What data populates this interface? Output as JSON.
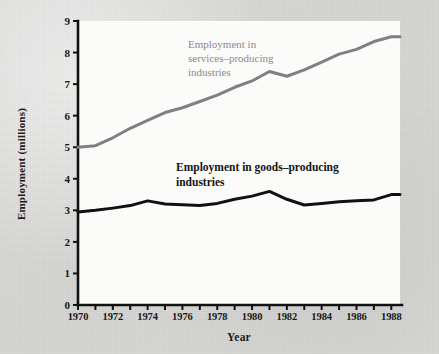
{
  "figure": {
    "background_color": "#d7d7d5",
    "plot_background_color": "#fbfbfa"
  },
  "axes": {
    "y_title": "Employment (millions)",
    "x_title": "Year",
    "y_tick_labels": [
      "9",
      "8",
      "7",
      "6",
      "5",
      "4",
      "3",
      "2",
      "1",
      "0"
    ],
    "x_tick_labels": [
      "1970",
      "1972",
      "1974",
      "1976",
      "1978",
      "1980",
      "1982",
      "1984",
      "1986",
      "1988"
    ]
  },
  "annotations": {
    "services": "Employment in\nservices–producing\nindustries",
    "goods": "Employment in goods–producing\nindustries"
  },
  "chart_data": {
    "type": "line",
    "title": "",
    "xlabel": "Year",
    "ylabel": "Employment (millions)",
    "xlim": [
      1970,
      1988.5
    ],
    "ylim": [
      0,
      9
    ],
    "grid": false,
    "legend": "inline-annotations",
    "x": [
      1970,
      1971,
      1972,
      1973,
      1974,
      1975,
      1976,
      1977,
      1978,
      1979,
      1980,
      1981,
      1982,
      1983,
      1984,
      1985,
      1986,
      1987,
      1988,
      1988.5
    ],
    "series": [
      {
        "name": "Employment in services–producing industries",
        "color": "#808080",
        "values": [
          5.0,
          5.05,
          5.3,
          5.6,
          5.85,
          6.1,
          6.25,
          6.45,
          6.65,
          6.9,
          7.1,
          7.4,
          7.25,
          7.45,
          7.7,
          7.95,
          8.1,
          8.35,
          8.5,
          8.5
        ]
      },
      {
        "name": "Employment in goods–producing industries",
        "color": "#111111",
        "values": [
          2.95,
          3.0,
          3.07,
          3.15,
          3.3,
          3.2,
          3.18,
          3.15,
          3.22,
          3.35,
          3.45,
          3.6,
          3.35,
          3.17,
          3.22,
          3.27,
          3.3,
          3.33,
          3.5,
          3.5
        ]
      }
    ]
  },
  "plot_geometry": {
    "left_px": 78,
    "right_px": 400,
    "top_px": 21,
    "bottom_px": 305,
    "x_min": 1970,
    "x_max": 1988.5,
    "y_min": 0,
    "y_max": 9
  }
}
